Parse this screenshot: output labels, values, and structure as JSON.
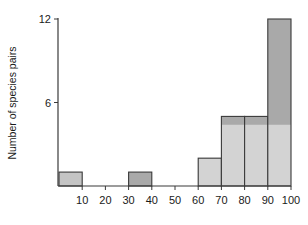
{
  "chart_data": {
    "type": "bar",
    "title": "",
    "xlabel": "",
    "ylabel": "Number of species pairs",
    "ylim": [
      0,
      12
    ],
    "xlim": [
      0,
      100
    ],
    "grid": false,
    "legend": null,
    "x_ticks": [
      "10",
      "20",
      "30",
      "40",
      "50",
      "60",
      "70",
      "80",
      "90",
      "100"
    ],
    "y_ticks": [
      "6",
      "12"
    ],
    "bins": [
      {
        "range": "0-10",
        "start": 0,
        "end": 10,
        "value": 1,
        "lower_value": 0
      },
      {
        "range": "10-20",
        "start": 10,
        "end": 20,
        "value": 0,
        "lower_value": 0
      },
      {
        "range": "20-30",
        "start": 20,
        "end": 30,
        "value": 0,
        "lower_value": 0
      },
      {
        "range": "30-40",
        "start": 30,
        "end": 40,
        "value": 1,
        "lower_value": 0
      },
      {
        "range": "40-50",
        "start": 40,
        "end": 50,
        "value": 0,
        "lower_value": 0
      },
      {
        "range": "50-60",
        "start": 50,
        "end": 60,
        "value": 0,
        "lower_value": 0
      },
      {
        "range": "60-70",
        "start": 60,
        "end": 70,
        "value": 2,
        "lower_value": 2
      },
      {
        "range": "70-80",
        "start": 70,
        "end": 80,
        "value": 5,
        "lower_value": 4.4
      },
      {
        "range": "80-90",
        "start": 80,
        "end": 90,
        "value": 5,
        "lower_value": 4.4
      },
      {
        "range": "90-100",
        "start": 90,
        "end": 100,
        "value": 12,
        "lower_value": 4.4
      }
    ],
    "colors": {
      "dark_fill": "#a9a9a9",
      "light_fill": "#d3d3d3",
      "outline": "#3a3a3a"
    }
  }
}
